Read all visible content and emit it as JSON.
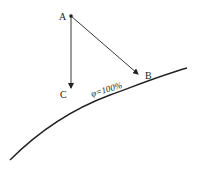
{
  "diagram": {
    "points": {
      "A": {
        "label": "A"
      },
      "B": {
        "label": "B"
      },
      "C": {
        "label": "C"
      }
    },
    "curve_label": "φ=100%",
    "arrows": [
      {
        "from": "A",
        "to": "B"
      },
      {
        "from": "A",
        "to": "C"
      }
    ],
    "line_color": "#222222"
  }
}
